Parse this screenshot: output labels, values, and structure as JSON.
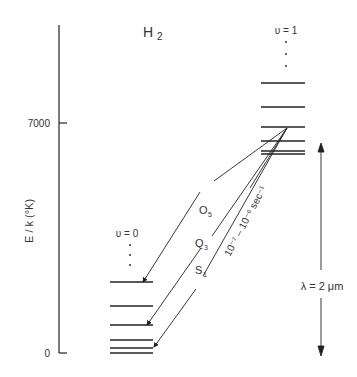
{
  "title": {
    "main": "H",
    "sub": "2"
  },
  "axis": {
    "label": "E / k  (°K)",
    "ticks": [
      {
        "value": "7000",
        "y": 123
      },
      {
        "value": "0",
        "y": 353
      }
    ]
  },
  "upper_state": {
    "label": "υ = 1",
    "dots": "⋮",
    "levels_y": [
      83,
      107,
      127,
      141,
      151,
      154
    ]
  },
  "lower_state": {
    "label": "υ = 0",
    "dots": "⋮",
    "levels_y": [
      282,
      306,
      325,
      340,
      348,
      353
    ]
  },
  "transitions": [
    {
      "label": "O",
      "sub": "5"
    },
    {
      "label": "Q",
      "sub": "3"
    },
    {
      "label": "S",
      "sub": "1"
    }
  ],
  "lifetime_label": "10⁻⁷ – 10⁻⁶ sec⁻¹",
  "wavelength_label": "λ = 2 μm",
  "colors": {
    "line": "#222222",
    "text": "#333333"
  }
}
